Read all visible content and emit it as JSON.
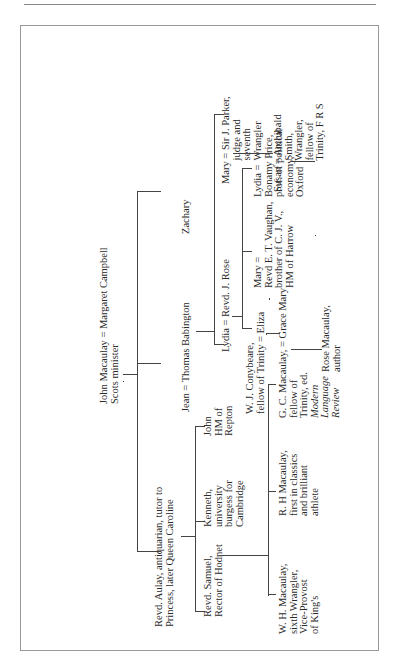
{
  "page": {
    "top_rule": true
  },
  "tree": {
    "root": {
      "label": "John Macaulay = Margaret Campbell\nScots minister"
    },
    "gen2": [
      {
        "label": "Revd. Aulay, antiquarian, tutor to\nPrincess, later Queen Caroline"
      },
      {
        "label": "Jean = Thomas Babington"
      },
      {
        "label": "Zachary"
      }
    ],
    "gen3_aulay": [
      {
        "label": "Revd. Samuel,\nRector of Hodnet"
      },
      {
        "label": "Kenneth,\nuniversity\nburgess for\nCambridge"
      },
      {
        "label": "John\nHM of\nRepton"
      }
    ],
    "gen3_babington": [
      {
        "label": "Lydia = Revd. J. Rose"
      },
      {
        "label": "Mary = Sir J. Parker,\n         judge and\n         seventh\n         Wrangler"
      }
    ],
    "gen4_samuel": [
      {
        "label": "W. H. Macaulay,\nsixth Wrangler,\nVice-Provost\nof King's"
      },
      {
        "label": "R. H Macaulay,\nfirst in classics\nand brilliant\nathlete"
      },
      {
        "label_lines": [
          "G. C. Macaulay, = Grace Mary",
          "fellow of",
          "Trinity, ed."
        ],
        "italic_lines": [
          "Modern",
          "Language",
          "Review"
        ]
      }
    ],
    "gen4_rose": [
      {
        "label": "W. J. Conybeare,\nfellow of Trinity = Eliza"
      },
      {
        "label": "Mary =\nRevd E. T. Vaughan,\nbrother of C. J. V.,\nHM of Harrow"
      },
      {
        "label": "Lydia =\nBonamy Price,\nprof. of political\neconomy,\nOxford"
      }
    ],
    "gen4_parker": [
      {
        "label": "Susan = Archibald\n            Smith,\n            Wrangler,\n            fellow of\n            Trinity, F R S"
      }
    ],
    "gen5_gc": [
      {
        "label": "Rose Macaulay,\nauthor"
      }
    ],
    "gen5_smith": [
      {
        "label": "J. P. Smith\nfellow of Trinity,\nwarden of\nWinchester"
      },
      {
        "label": "A. H. Smith,\nF B A keeper\nof Greek\nand Roman\nantiquities\nat the British\nMuseum"
      },
      {
        "label": "Sir Henry\nBabington\nSmith, fellow of\nTrinity and\ncivil servant"
      }
    ],
    "gen6_henry": [
      {
        "label": "Bernard\nBabington Smith,\nlecturer in\npsychology, Oxford"
      }
    ]
  }
}
